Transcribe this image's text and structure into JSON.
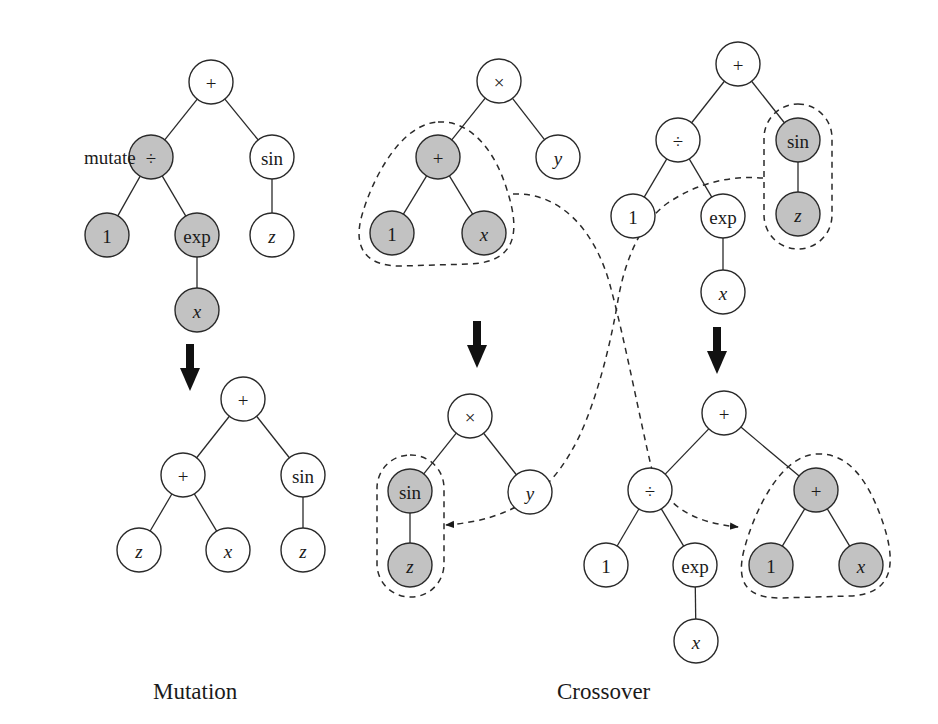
{
  "colors": {
    "shaded": "#c2c2c2",
    "plain": "#ffffff",
    "stroke": "#2a2a2a"
  },
  "captions": {
    "mutation": "Mutation",
    "crossover": "Crossover"
  },
  "mutate_label": "mutate",
  "trees": [
    {
      "id": "mutation-parent",
      "nodes": [
        {
          "id": "a0",
          "label": "+",
          "x": 211,
          "y": 82,
          "shaded": false,
          "var": false
        },
        {
          "id": "a1",
          "label": "÷",
          "x": 151,
          "y": 157,
          "shaded": true,
          "var": false
        },
        {
          "id": "a2",
          "label": "sin",
          "x": 272,
          "y": 157,
          "shaded": false,
          "var": false
        },
        {
          "id": "a3",
          "label": "1",
          "x": 107,
          "y": 235,
          "shaded": true,
          "var": false
        },
        {
          "id": "a4",
          "label": "exp",
          "x": 197,
          "y": 235,
          "shaded": true,
          "var": false
        },
        {
          "id": "a5",
          "label": "z",
          "x": 272,
          "y": 235,
          "shaded": false,
          "var": true
        },
        {
          "id": "a6",
          "label": "x",
          "x": 197,
          "y": 310,
          "shaded": true,
          "var": true
        }
      ],
      "edges": [
        [
          "a0",
          "a1"
        ],
        [
          "a0",
          "a2"
        ],
        [
          "a1",
          "a3"
        ],
        [
          "a1",
          "a4"
        ],
        [
          "a2",
          "a5"
        ],
        [
          "a4",
          "a6"
        ]
      ]
    },
    {
      "id": "mutation-child",
      "nodes": [
        {
          "id": "b0",
          "label": "+",
          "x": 243,
          "y": 399,
          "shaded": false,
          "var": false
        },
        {
          "id": "b1",
          "label": "+",
          "x": 183,
          "y": 475,
          "shaded": false,
          "var": false
        },
        {
          "id": "b2",
          "label": "sin",
          "x": 303,
          "y": 475,
          "shaded": false,
          "var": false
        },
        {
          "id": "b3",
          "label": "z",
          "x": 139,
          "y": 550,
          "shaded": false,
          "var": true
        },
        {
          "id": "b4",
          "label": "x",
          "x": 228,
          "y": 550,
          "shaded": false,
          "var": true
        },
        {
          "id": "b5",
          "label": "z",
          "x": 303,
          "y": 550,
          "shaded": false,
          "var": true
        }
      ],
      "edges": [
        [
          "b0",
          "b1"
        ],
        [
          "b0",
          "b2"
        ],
        [
          "b1",
          "b3"
        ],
        [
          "b1",
          "b4"
        ],
        [
          "b2",
          "b5"
        ]
      ]
    },
    {
      "id": "crossover-parent-1",
      "nodes": [
        {
          "id": "c0",
          "label": "×",
          "x": 499,
          "y": 81,
          "shaded": false,
          "var": false
        },
        {
          "id": "c1",
          "label": "+",
          "x": 438,
          "y": 157,
          "shaded": true,
          "var": false
        },
        {
          "id": "c2",
          "label": "y",
          "x": 558,
          "y": 157,
          "shaded": false,
          "var": true
        },
        {
          "id": "c3",
          "label": "1",
          "x": 392,
          "y": 233,
          "shaded": true,
          "var": false
        },
        {
          "id": "c4",
          "label": "x",
          "x": 484,
          "y": 233,
          "shaded": true,
          "var": true
        }
      ],
      "edges": [
        [
          "c0",
          "c1"
        ],
        [
          "c0",
          "c2"
        ],
        [
          "c1",
          "c3"
        ],
        [
          "c1",
          "c4"
        ]
      ]
    },
    {
      "id": "crossover-parent-2",
      "nodes": [
        {
          "id": "d0",
          "label": "+",
          "x": 738,
          "y": 64,
          "shaded": false,
          "var": false
        },
        {
          "id": "d1",
          "label": "÷",
          "x": 678,
          "y": 140,
          "shaded": false,
          "var": false
        },
        {
          "id": "d2",
          "label": "sin",
          "x": 798,
          "y": 140,
          "shaded": true,
          "var": false
        },
        {
          "id": "d3",
          "label": "1",
          "x": 633,
          "y": 216,
          "shaded": false,
          "var": false
        },
        {
          "id": "d4",
          "label": "exp",
          "x": 723,
          "y": 216,
          "shaded": false,
          "var": false
        },
        {
          "id": "d5",
          "label": "z",
          "x": 798,
          "y": 214,
          "shaded": true,
          "var": true
        },
        {
          "id": "d6",
          "label": "x",
          "x": 723,
          "y": 292,
          "shaded": false,
          "var": true
        }
      ],
      "edges": [
        [
          "d0",
          "d1"
        ],
        [
          "d0",
          "d2"
        ],
        [
          "d1",
          "d3"
        ],
        [
          "d1",
          "d4"
        ],
        [
          "d2",
          "d5"
        ],
        [
          "d4",
          "d6"
        ]
      ]
    },
    {
      "id": "crossover-child-1",
      "nodes": [
        {
          "id": "e0",
          "label": "×",
          "x": 470,
          "y": 416,
          "shaded": false,
          "var": false
        },
        {
          "id": "e1",
          "label": "sin",
          "x": 410,
          "y": 491,
          "shaded": true,
          "var": false
        },
        {
          "id": "e2",
          "label": "y",
          "x": 530,
          "y": 492,
          "shaded": false,
          "var": true
        },
        {
          "id": "e3",
          "label": "z",
          "x": 410,
          "y": 565,
          "shaded": true,
          "var": true
        }
      ],
      "edges": [
        [
          "e0",
          "e1"
        ],
        [
          "e0",
          "e2"
        ],
        [
          "e1",
          "e3"
        ]
      ]
    },
    {
      "id": "crossover-child-2",
      "nodes": [
        {
          "id": "f0",
          "label": "+",
          "x": 724,
          "y": 413,
          "shaded": false,
          "var": false
        },
        {
          "id": "f1",
          "label": "÷",
          "x": 650,
          "y": 490,
          "shaded": false,
          "var": false
        },
        {
          "id": "f2",
          "label": "+",
          "x": 816,
          "y": 490,
          "shaded": true,
          "var": false
        },
        {
          "id": "f3",
          "label": "1",
          "x": 606,
          "y": 565,
          "shaded": false,
          "var": false
        },
        {
          "id": "f4",
          "label": "exp",
          "x": 695,
          "y": 565,
          "shaded": false,
          "var": false
        },
        {
          "id": "f5",
          "label": "1",
          "x": 771,
          "y": 565,
          "shaded": true,
          "var": false
        },
        {
          "id": "f6",
          "label": "x",
          "x": 861,
          "y": 565,
          "shaded": true,
          "var": true
        },
        {
          "id": "f7",
          "label": "x",
          "x": 696,
          "y": 641,
          "shaded": false,
          "var": true
        }
      ],
      "edges": [
        [
          "f0",
          "f1"
        ],
        [
          "f0",
          "f2"
        ],
        [
          "f1",
          "f3"
        ],
        [
          "f1",
          "f4"
        ],
        [
          "f2",
          "f5"
        ],
        [
          "f2",
          "f6"
        ],
        [
          "f4",
          "f7"
        ]
      ]
    }
  ]
}
